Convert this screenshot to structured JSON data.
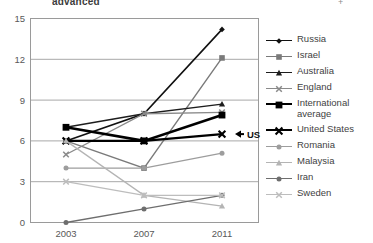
{
  "page": {
    "cut_off_title": "advanced",
    "cut_off_right_tick": "+"
  },
  "axes": {
    "y_ticks": [
      "0",
      "3",
      "6",
      "9",
      "12",
      "15"
    ],
    "x_ticks": [
      "2003",
      "2007",
      "2011"
    ]
  },
  "annotation": {
    "label": "US",
    "marker_glyph": "X",
    "arrow_glyph": "◀"
  },
  "legend": {
    "position": "right",
    "entries": [
      {
        "label": "Russia",
        "marker": "diamond",
        "color": "#111111",
        "width": 1.6
      },
      {
        "label": "Israel",
        "marker": "square",
        "color": "#7a7a7a",
        "width": 1.4
      },
      {
        "label": "Australia",
        "marker": "triangle",
        "color": "#1d1d1d",
        "width": 1.4
      },
      {
        "label": "England",
        "marker": "x",
        "color": "#8a8a8a",
        "width": 1.4
      },
      {
        "label": "International average",
        "marker": "square",
        "color": "#000000",
        "width": 2.6
      },
      {
        "label": "United States",
        "marker": "x",
        "color": "#000000",
        "width": 2.2
      },
      {
        "label": "Romania",
        "marker": "circle",
        "color": "#9d9d9d",
        "width": 1.3
      },
      {
        "label": "Malaysia",
        "marker": "triangle",
        "color": "#b4b4b4",
        "width": 1.3
      },
      {
        "label": "Iran",
        "marker": "circle",
        "color": "#6e6e6e",
        "width": 1.3
      },
      {
        "label": "Sweden",
        "marker": "x",
        "color": "#bdbdbd",
        "width": 1.3
      }
    ]
  },
  "chart_data": {
    "type": "line",
    "title": "advanced",
    "xlabel": "",
    "ylabel": "",
    "x": [
      "2003",
      "2007",
      "2011"
    ],
    "categories": [
      "2003",
      "2007",
      "2011"
    ],
    "ylim": [
      0,
      15
    ],
    "y_ticks": [
      0,
      3,
      6,
      9,
      12,
      15
    ],
    "grid": "horizontal",
    "legend_position": "right",
    "annotations": [
      {
        "text": "US",
        "series": "United States",
        "x": "2011",
        "y": 6.5
      }
    ],
    "series": [
      {
        "name": "Russia",
        "values": [
          6.0,
          8.0,
          14.2
        ],
        "marker": "diamond",
        "color": "#111111"
      },
      {
        "name": "Israel",
        "values": [
          6.0,
          4.0,
          12.1
        ],
        "marker": "square",
        "color": "#7a7a7a"
      },
      {
        "name": "Australia",
        "values": [
          7.0,
          8.0,
          8.7
        ],
        "marker": "triangle",
        "color": "#1d1d1d"
      },
      {
        "name": "England",
        "values": [
          5.0,
          8.0,
          8.1
        ],
        "marker": "x",
        "color": "#8a8a8a"
      },
      {
        "name": "International average",
        "values": [
          7.0,
          6.0,
          7.9
        ],
        "marker": "square",
        "color": "#000000"
      },
      {
        "name": "United States",
        "values": [
          6.0,
          6.0,
          6.5
        ],
        "marker": "x",
        "color": "#000000"
      },
      {
        "name": "Romania",
        "values": [
          4.0,
          4.0,
          5.1
        ],
        "marker": "circle",
        "color": "#9d9d9d"
      },
      {
        "name": "Malaysia",
        "values": [
          6.0,
          2.0,
          1.2
        ],
        "marker": "triangle",
        "color": "#b4b4b4"
      },
      {
        "name": "Iran",
        "values": [
          0.0,
          1.0,
          2.0
        ],
        "marker": "circle",
        "color": "#6e6e6e"
      },
      {
        "name": "Sweden",
        "values": [
          3.0,
          2.0,
          2.0
        ],
        "marker": "x",
        "color": "#bdbdbd"
      }
    ]
  }
}
